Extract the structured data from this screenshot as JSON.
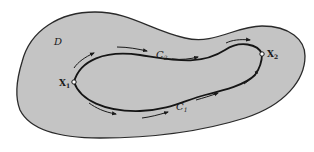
{
  "diagram": {
    "region_label": "D",
    "start_point": {
      "label": "X",
      "subscript": "1"
    },
    "end_point": {
      "label": "X",
      "subscript": "2"
    },
    "upper_path": {
      "label": "C",
      "subscript": "2"
    },
    "lower_path": {
      "label": "C",
      "subscript": "1"
    },
    "colors": {
      "region_fill": "#c4c4c4",
      "outline": "#2a2a2a",
      "background": "#ffffff"
    }
  }
}
